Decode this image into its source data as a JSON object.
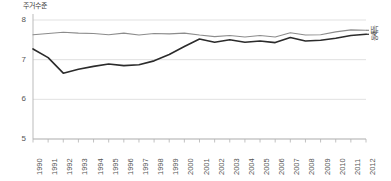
{
  "chart_data": {
    "type": "line",
    "title": "주거수준",
    "xlabel": "",
    "ylabel": "주거수준",
    "ylim": [
      5,
      8
    ],
    "yticks": [
      5,
      6,
      7,
      8
    ],
    "grid": true,
    "legend_position": "right",
    "categories": [
      "1990",
      "1991",
      "1992",
      "1993",
      "1994",
      "1995",
      "1996",
      "1997",
      "1998",
      "1999",
      "2000",
      "2001",
      "2002",
      "2003",
      "2004",
      "2005",
      "2006",
      "2007",
      "2008",
      "2009",
      "2010",
      "2011",
      "2012"
    ],
    "series": [
      {
        "name": "서독",
        "color": "#8c8c8c",
        "values": [
          7.63,
          7.66,
          7.69,
          7.67,
          7.66,
          7.63,
          7.67,
          7.62,
          7.66,
          7.65,
          7.67,
          7.62,
          7.58,
          7.61,
          7.57,
          7.61,
          7.57,
          7.68,
          7.62,
          7.63,
          7.7,
          7.75,
          7.74
        ]
      },
      {
        "name": "동독",
        "color": "#2b2b2b",
        "values": [
          7.27,
          7.05,
          6.66,
          6.76,
          6.83,
          6.89,
          6.85,
          6.87,
          6.97,
          7.13,
          7.33,
          7.52,
          7.44,
          7.5,
          7.44,
          7.47,
          7.43,
          7.56,
          7.47,
          7.49,
          7.54,
          7.61,
          7.64
        ]
      }
    ]
  },
  "legend": {
    "items": [
      {
        "label": "서독"
      },
      {
        "label": "동독"
      }
    ]
  }
}
